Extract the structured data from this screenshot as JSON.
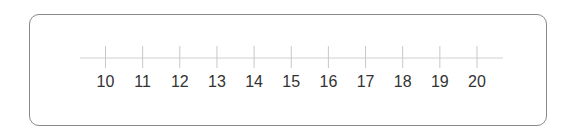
{
  "diagram": {
    "type": "number-line",
    "start": 10,
    "end": 20,
    "step": 1,
    "ticks": [
      "10",
      "11",
      "12",
      "13",
      "14",
      "15",
      "16",
      "17",
      "18",
      "19",
      "20"
    ],
    "colors": {
      "frame": "#8a8a8a",
      "axis": "#d0d0d0",
      "tick": "#c8c8c8",
      "label": "#333333"
    }
  }
}
